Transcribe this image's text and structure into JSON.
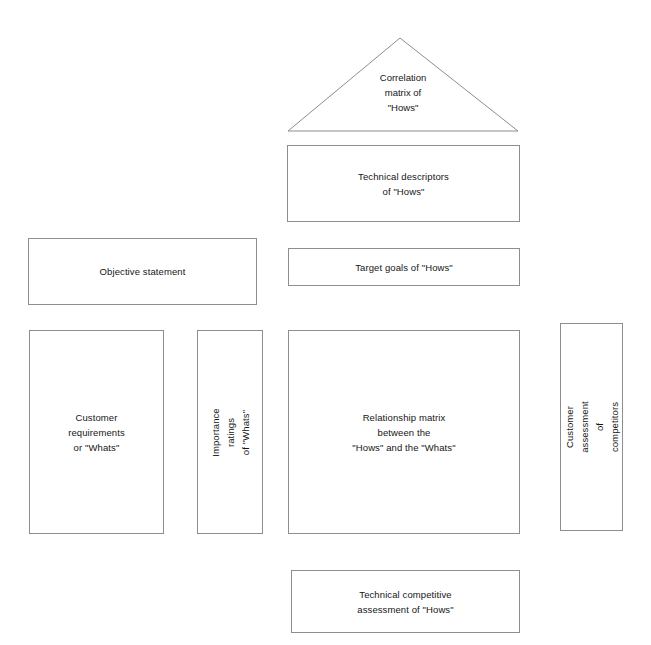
{
  "diagram": {
    "line_color": "#8d8d8d",
    "text_color": "#161616",
    "background": "#ffffff",
    "nodes": [
      {
        "id": "correlation-matrix",
        "label": "Correlation\nmatrix of\n\"Hows\"",
        "shape": "triangle"
      },
      {
        "id": "technical-descriptors",
        "label": "Technical descriptors\nof \"Hows\"",
        "shape": "rectangle"
      },
      {
        "id": "objective-statement",
        "label": "Objective statement",
        "shape": "rectangle"
      },
      {
        "id": "target-goals",
        "label": "Target goals of \"Hows\"",
        "shape": "rectangle"
      },
      {
        "id": "customer-requirements",
        "label": "Customer\nrequirements\nor \"Whats\"",
        "shape": "rectangle"
      },
      {
        "id": "importance-ratings",
        "label": "Importance ratings\nof \"Whats\"",
        "shape": "rectangle",
        "orientation": "vertical"
      },
      {
        "id": "relationship-matrix",
        "label": "Relationship matrix\nbetween the\n\"Hows\" and the \"Whats\"",
        "shape": "rectangle"
      },
      {
        "id": "customer-assessment",
        "label": "Customer assessment\nof competitors",
        "shape": "rectangle",
        "orientation": "vertical"
      },
      {
        "id": "technical-competitive-assessment",
        "label": "Technical competitive\nassessment of \"Hows\"",
        "shape": "rectangle"
      }
    ]
  }
}
